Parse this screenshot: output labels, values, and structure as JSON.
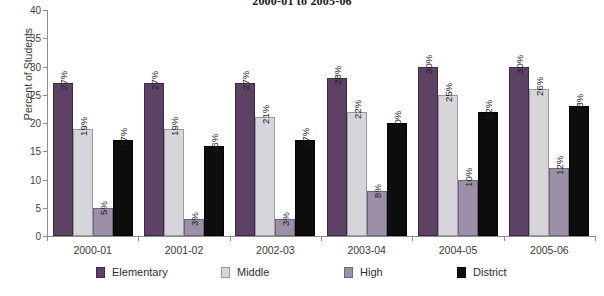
{
  "chart_data": {
    "type": "bar",
    "title": "2000-01 to 2005-06",
    "xlabel": "",
    "ylabel": "Percent of Students",
    "ylim": [
      0,
      40
    ],
    "yticks": [
      0,
      5,
      10,
      15,
      20,
      25,
      30,
      35,
      40
    ],
    "grid": false,
    "legend_position": "bottom",
    "value_label_suffix": "%",
    "value_labels_rotated": true,
    "categories": [
      "2000-01",
      "2001-02",
      "2002-03",
      "2003-04",
      "2004-05",
      "2005-06"
    ],
    "series": [
      {
        "name": "Elementary",
        "color": "#5d4266",
        "values": [
          27,
          27,
          27,
          28,
          30,
          30
        ],
        "labels": [
          "27%",
          "27%",
          "27%",
          "28%",
          "30%",
          "30%"
        ]
      },
      {
        "name": "Middle",
        "color": "#d6d6da",
        "values": [
          19,
          19,
          21,
          22,
          25,
          26
        ],
        "labels": [
          "19%",
          "19%",
          "21%",
          "22%",
          "25%",
          "26%"
        ]
      },
      {
        "name": "High",
        "color": "#9b90a8",
        "values": [
          5,
          3,
          3,
          8,
          10,
          12
        ],
        "labels": [
          "5%",
          "3%",
          "3%",
          "8%",
          "10%",
          "12%"
        ]
      },
      {
        "name": "District",
        "color": "#0d0d0d",
        "values": [
          17,
          16,
          17,
          20,
          22,
          23
        ],
        "labels": [
          "17%",
          "16%",
          "17%",
          "20%",
          "22%",
          "23%"
        ]
      }
    ]
  },
  "axis": {
    "y_title": "Percent of Students",
    "y_tick_labels": [
      "0",
      "5",
      "10",
      "15",
      "20",
      "25",
      "30",
      "35",
      "40"
    ]
  },
  "legend": {
    "items": [
      {
        "label": "Elementary",
        "swatch": "elementary"
      },
      {
        "label": "Middle",
        "swatch": "middle"
      },
      {
        "label": "High",
        "swatch": "high"
      },
      {
        "label": "District",
        "swatch": "district"
      }
    ]
  }
}
